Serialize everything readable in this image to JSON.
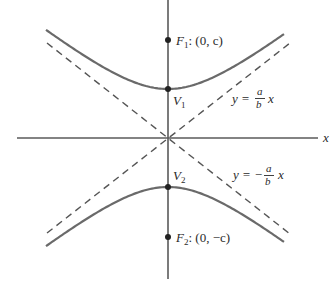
{
  "diagram": {
    "type": "hyperbola",
    "equation_form": "y^2/a^2 - x^2/b^2 = 1",
    "colors": {
      "axis": "#555555",
      "curve": "#666666",
      "asymptote": "#555555",
      "point": "#222222",
      "text": "#2a2a2a"
    },
    "axes": {
      "x_label": "x"
    },
    "points": {
      "F1": {
        "name": "F",
        "sub": "1",
        "coords": ": (0, c)"
      },
      "V1": {
        "name": "V",
        "sub": "1"
      },
      "V2": {
        "name": "V",
        "sub": "2"
      },
      "F2": {
        "name": "F",
        "sub": "2",
        "coords": ": (0, −c)"
      }
    },
    "asymptotes": {
      "positive": {
        "lhs": "y = ",
        "num": "a",
        "den": "b",
        "var": "x"
      },
      "negative": {
        "lhs": "y = − ",
        "num": "a",
        "den": "b",
        "var": "x"
      }
    }
  }
}
